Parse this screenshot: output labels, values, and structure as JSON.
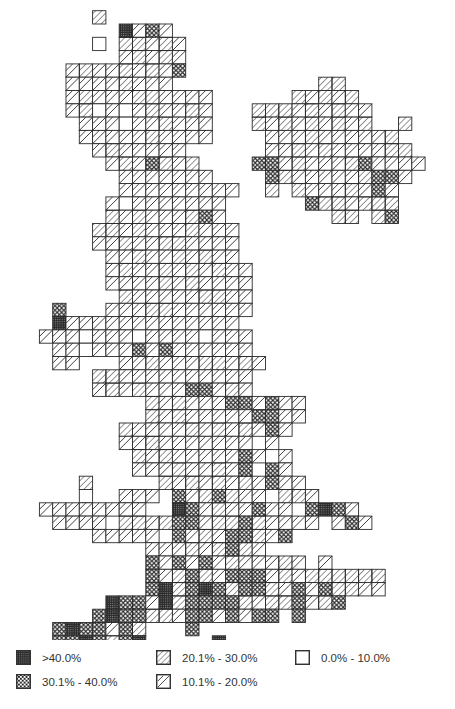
{
  "map": {
    "cell_size": 13.3,
    "origin_x": 12.8,
    "origin_y": -2.6,
    "codes": {
      "B": ">40.0%",
      "X": "30.1% - 40.0%",
      "D": "20.1% - 30.0%",
      "d": "10.1% - 20.0%",
      "O": "0.0% - 10.0%"
    },
    "rows": [
      "",
      "......D",
      "........BdXd",
      "......O.DDdDd",
      "........dDdDd",
      "....dDddDdDdX",
      "....ddddDddd",
      "....dDdddDDdddd",
      "....dDOdOdDddDd",
      ".....dddOddDddd",
      ".....dddddDdddd",
      "......dDddddd",
      ".......dDdXDdD",
      "........ddddddd",
      "........ddddddddd",
      ".......dOddddddd",
      ".......DdDdddDXd",
      "......DDdDdddDddd",
      "......ddDddDDdddd",
      ".......ddDddDdDdd",
      ".......dDddDdDdDdd",
      ".......ddddDdDdddd",
      "........DdddddDDdd",
      "...X...dddDDdddddd",
      "...Bddddddddddddd",
      "..dddOdddOddddOddd",
      "...ddOdddXdXdddddd",
      "...dd...ddDdddDDdDd",
      "......DDdddddddddd",
      "......dDdDdddXXdDd",
      "..........DdDdddXXdXdd",
      "..........DdDdddddXXdd",
      "........DddddDdDdDdXd",
      "........ddDddddddd.d",
      ".........DdDdddddXd.d",
      ".........dddDddDdX.Xd",
      ".....D.....DdDdDdDdXdd",
      ".....O..ddd.XdDXDdd.DDd",
      "..dddddddd..BXdDddXdd.XBXd",
      "...dddd.DDdDXXdDDXDdddd.dXd",
      "......ddddd.XdDdXXDdX.....",
      "..........dddDdDXDd",
      "..........XdXdXdDdddDd.d",
      "..........XdDXDdXXXdDdDDDDDD",
      "..........XBDXBXDXXDdXdXDDdd",
      ".......BXXdBDXXXXDdDDXdDX",
      "......XBXXDDdXXdXdXX.X",
      "...XBXXdXD...X",
      "...XXBXDXB.....B",
      "..XDd.X"
    ],
    "ireland_rows_offset_col": 0,
    "ireland_rows": [
      {
        "row": 6,
        "cells": ".......................DD"
      },
      {
        "row": 7,
        "cells": ".....................DdDdD"
      },
      {
        "row": 8,
        "cells": "..................DDDdDdDdd"
      },
      {
        "row": 9,
        "cells": "..................DdDdDdDdD..D"
      },
      {
        "row": 10,
        "cells": "...................dddDdddddD"
      },
      {
        "row": 11,
        "cells": "...................ddDdDddddDD"
      },
      {
        "row": 12,
        "cells": "..................XXdDdddDXdddd"
      },
      {
        "row": 13,
        "cells": "...................XDdddddDXXd"
      },
      {
        "row": 14,
        "cells": "...................D.DdddDdXd"
      },
      {
        "row": 15,
        "cells": "......................XDDdDDD"
      },
      {
        "row": 16,
        "cells": "........................DD.DX"
      }
    ]
  },
  "legend": {
    "items": [
      {
        "code": "B",
        "label": ">40.0%"
      },
      {
        "code": "X",
        "label": "30.1% - 40.0%"
      },
      {
        "code": "D",
        "label": "20.1% - 30.0%"
      },
      {
        "code": "d",
        "label": "10.1% - 20.0%"
      },
      {
        "code": "O",
        "label": "0.0% - 10.0%"
      }
    ]
  },
  "colors": {
    "line": "#2a2a2a",
    "dark_fill": "#2b2b2b",
    "background": "#ffffff"
  }
}
